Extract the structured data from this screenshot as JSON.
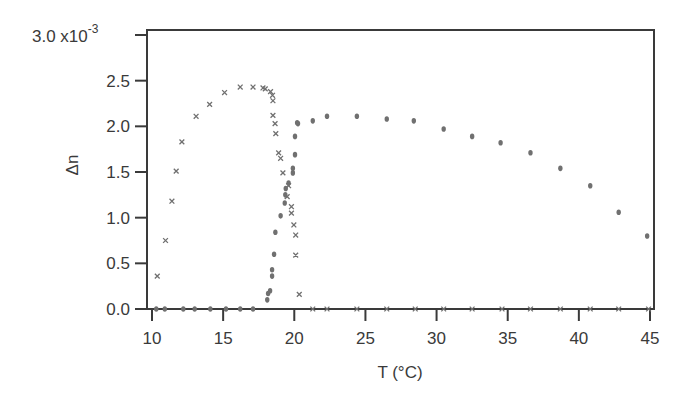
{
  "chart_data": {
    "type": "scatter",
    "title": "",
    "xlabel": "T (°C)",
    "ylabel": "Δn",
    "y_multiplier_label": "x10",
    "y_multiplier_exponent": "-3",
    "xlim": [
      10,
      45
    ],
    "ylim": [
      0.0,
      3.0
    ],
    "x_ticks": [
      10,
      15,
      20,
      25,
      30,
      35,
      40,
      45
    ],
    "x_tick_labels": [
      "10",
      "15",
      "20",
      "25",
      "30",
      "35",
      "40",
      "45"
    ],
    "y_ticks": [
      0.0,
      0.5,
      1.0,
      1.5,
      2.0,
      2.5,
      3.0
    ],
    "y_tick_labels": [
      "0.0",
      "0.5",
      "1.0",
      "1.5",
      "2.0",
      "2.5",
      "3.0"
    ],
    "grid": false,
    "legend": "none",
    "colors": {
      "frame": "#3a3a3a",
      "markers": "#707070"
    },
    "series": [
      {
        "name": "cross markers",
        "marker": "x",
        "x": [
          10.37,
          10.95,
          11.4,
          11.7,
          12.1,
          13.1,
          14.05,
          15.1,
          16.2,
          17.1,
          17.8,
          17.96,
          18.33,
          18.47,
          18.5,
          18.5,
          18.65,
          18.7,
          18.9,
          19.04,
          19.2,
          19.5,
          19.6,
          19.8,
          19.8,
          19.97,
          20.1,
          20.1,
          20.35,
          21.3,
          22.3,
          24.4,
          26.5,
          28.5,
          30.5,
          32.5,
          34.6,
          36.6,
          38.7,
          40.8,
          42.8,
          44.9
        ],
        "y": [
          0.36,
          0.75,
          1.18,
          1.51,
          1.83,
          2.11,
          2.24,
          2.37,
          2.43,
          2.43,
          2.42,
          2.41,
          2.38,
          2.34,
          2.28,
          2.12,
          2.03,
          1.92,
          1.71,
          1.65,
          1.49,
          1.23,
          1.35,
          1.12,
          1.05,
          0.92,
          0.81,
          0.59,
          0.16,
          0.0,
          0.0,
          0.0,
          0.0,
          0.0,
          0.0,
          0.0,
          0.0,
          0.0,
          0.0,
          0.0,
          0.0,
          0.0
        ]
      },
      {
        "name": "circle markers",
        "marker": "o",
        "x": [
          10.3,
          10.9,
          12.2,
          13.0,
          14.1,
          15.2,
          16.2,
          17.1,
          18.1,
          18.16,
          18.3,
          18.44,
          18.44,
          18.58,
          18.67,
          19.04,
          19.33,
          19.37,
          19.4,
          19.6,
          19.9,
          19.9,
          20.05,
          20.05,
          20.2,
          20.26,
          21.3,
          22.3,
          24.4,
          26.5,
          28.4,
          30.5,
          32.5,
          34.5,
          36.6,
          38.7,
          40.8,
          42.8,
          44.8
        ],
        "y": [
          0.0,
          0.0,
          0.0,
          0.0,
          0.0,
          0.0,
          0.0,
          0.0,
          0.1,
          0.17,
          0.2,
          0.36,
          0.43,
          0.6,
          0.84,
          1.02,
          1.16,
          1.25,
          1.32,
          1.38,
          1.49,
          1.54,
          1.69,
          1.89,
          2.04,
          2.03,
          2.06,
          2.11,
          2.11,
          2.08,
          2.06,
          1.97,
          1.89,
          1.82,
          1.71,
          1.54,
          1.35,
          1.06,
          0.8
        ]
      }
    ]
  },
  "layout": {
    "plot_left": 147,
    "plot_right": 654,
    "plot_top": 30,
    "plot_bottom": 309,
    "x_px_start": 152,
    "x_px_end": 650,
    "y_px_zero": 309,
    "y_px_max": 35
  }
}
